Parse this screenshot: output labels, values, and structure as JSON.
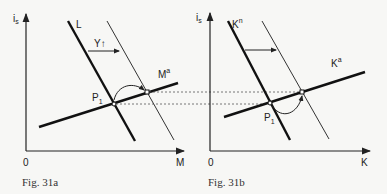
{
  "figures": [
    {
      "id": "31a",
      "caption": "Fig. 31a",
      "y_axis_label": "i",
      "y_axis_sub": "s",
      "x_axis_label": "M",
      "origin_label": "0",
      "curves": {
        "demand": {
          "label": "L"
        },
        "supply": {
          "label": "M",
          "sup": "a"
        }
      },
      "shift_label": "Y↑",
      "point_label": "P",
      "point_sub": "1"
    },
    {
      "id": "31b",
      "caption": "Fig. 31b",
      "y_axis_label": "i",
      "y_axis_sub": "s",
      "x_axis_label": "K",
      "origin_label": "0",
      "curves": {
        "demand": {
          "label": "K",
          "sup": "n"
        },
        "supply": {
          "label": "K",
          "sup": "a"
        }
      },
      "point_label": "P",
      "point_sub": "1"
    }
  ]
}
